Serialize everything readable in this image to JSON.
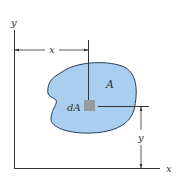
{
  "diagram": {
    "axis_labels": {
      "y": "y",
      "x": "x"
    },
    "dimension_labels": {
      "x": "x",
      "y": "y"
    },
    "region_label": "A",
    "element_label": "dA",
    "colors": {
      "region_fill": "#a9cff0",
      "region_stroke": "#2a3a55",
      "element_fill": "#9a9a9a",
      "line": "#333333"
    }
  }
}
